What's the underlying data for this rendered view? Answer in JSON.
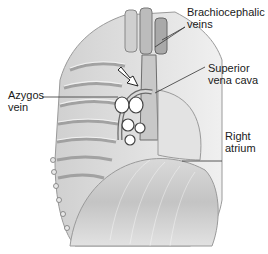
{
  "figure": {
    "labels": [
      {
        "id": "brachiocephalic",
        "lines": [
          "Brachiocephalic",
          "veins"
        ]
      },
      {
        "id": "svc",
        "lines": [
          "Superior",
          "vena cava"
        ]
      },
      {
        "id": "azygos",
        "lines": [
          "Azygos",
          "vein"
        ]
      },
      {
        "id": "right-atrium",
        "lines": [
          "Right",
          "atrium"
        ]
      }
    ],
    "colors": {
      "ink": "#1a1a1a",
      "leader": "#333333",
      "tissue_light": "#e6e6e6",
      "tissue_mid": "#bdbdbd",
      "tissue_dark": "#7a7a7a"
    }
  }
}
